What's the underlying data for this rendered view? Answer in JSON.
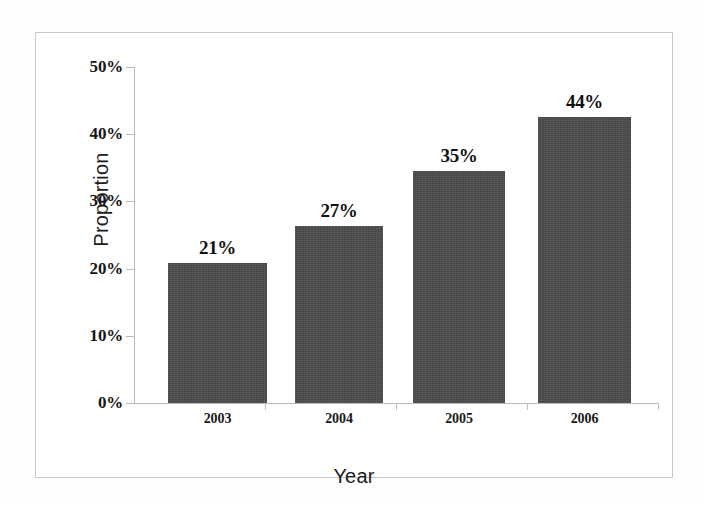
{
  "figure": {
    "background_color": "#fdfdfd",
    "frame_color": "#c8c8c8",
    "bar_color": "#474747",
    "axis_color": "#b9b9b9"
  },
  "chart_data": {
    "type": "bar",
    "title": "",
    "subtitle": "",
    "xlabel": "Year",
    "ylabel": "Proportion",
    "categories": [
      "2003",
      "2004",
      "2005",
      "2006"
    ],
    "values": [
      21,
      27,
      35,
      44
    ],
    "bar_heights_percent": [
      20.8,
      26.4,
      34.5,
      42.5
    ],
    "data_labels": [
      "21%",
      "27%",
      "35%",
      "44%"
    ],
    "ylim": [
      0,
      50
    ],
    "ytick_values": [
      0,
      10,
      20,
      30,
      40,
      50
    ],
    "ytick_labels": [
      "0%",
      "10%",
      "20%",
      "30%",
      "40%",
      "50%"
    ],
    "grid": false,
    "legend": null,
    "legend_position": "none",
    "series": [
      {
        "name": "Proportion",
        "color": "#474747",
        "values": [
          21,
          27,
          35,
          44
        ]
      }
    ],
    "annotations": []
  }
}
